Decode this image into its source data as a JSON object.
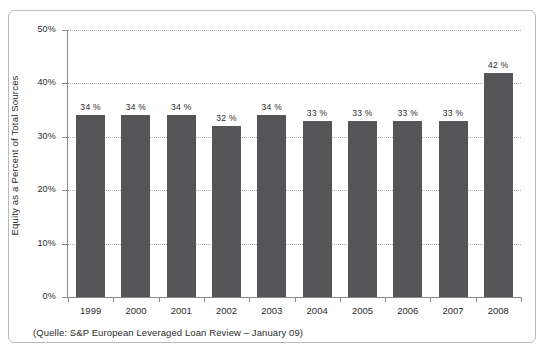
{
  "chart_data": {
    "type": "bar",
    "title": "",
    "subtitle": "",
    "xlabel": "",
    "ylabel": "Equity as a Percent of Total Sources",
    "categories": [
      "1999",
      "2000",
      "2001",
      "2002",
      "2003",
      "2004",
      "2005",
      "2006",
      "2007",
      "2008"
    ],
    "values": [
      34,
      34,
      34,
      32,
      34,
      33,
      33,
      33,
      33,
      42
    ],
    "data_labels": [
      "34 %",
      "34 %",
      "34 %",
      "32 %",
      "34 %",
      "33 %",
      "33 %",
      "33 %",
      "33 %",
      "42 %"
    ],
    "ylim": [
      0,
      50
    ],
    "ytick_values": [
      0,
      10,
      20,
      30,
      40,
      50
    ],
    "ytick_labels": [
      "0%",
      "10%",
      "20%",
      "30%",
      "40%",
      "50%"
    ],
    "grid": "horizontal-dotted",
    "legend": "none",
    "bar_color": "#555558",
    "axis_color": "#8a8a8c",
    "grid_color": "#b0b0b2",
    "frame_color": "#b9b9bb",
    "text_color": "#2b2b2b"
  },
  "source_note": "(Quelle: S&P European Leveraged Loan Review – January 09)"
}
